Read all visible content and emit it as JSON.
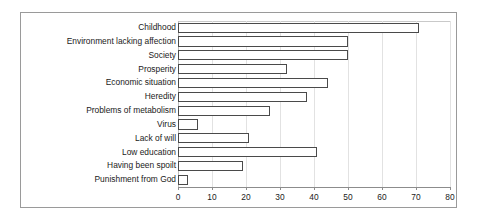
{
  "chart_data": {
    "type": "bar",
    "orientation": "horizontal",
    "title": "",
    "subtitle": "",
    "xlabel": "",
    "ylabel": "",
    "xlim": [
      0,
      80
    ],
    "xticks": [
      0,
      10,
      20,
      30,
      40,
      50,
      60,
      70,
      80
    ],
    "xtick_labels": [
      "0",
      "10",
      "20",
      "30",
      "40",
      "50",
      "60",
      "70",
      "80"
    ],
    "grid": true,
    "grid_axis": "x",
    "legend": false,
    "legend_position": "none",
    "bar_face_color": "#ffffff",
    "bar_edge_color": "#4a4a4a",
    "grid_color": "#e2e2e2",
    "frame_color": "#9a9a9a",
    "text_color": "#1a1a1a",
    "categories": [
      "Childhood",
      "Environment lacking affection",
      "Society",
      "Prosperity",
      "Economic situation",
      "Heredity",
      "Problems of metabolism",
      "Virus",
      "Lack of will",
      "Low education",
      "Having been spoilt",
      "Punishment from God"
    ],
    "values": [
      71,
      50,
      50,
      32,
      44,
      38,
      27,
      6,
      21,
      41,
      19,
      3
    ]
  }
}
